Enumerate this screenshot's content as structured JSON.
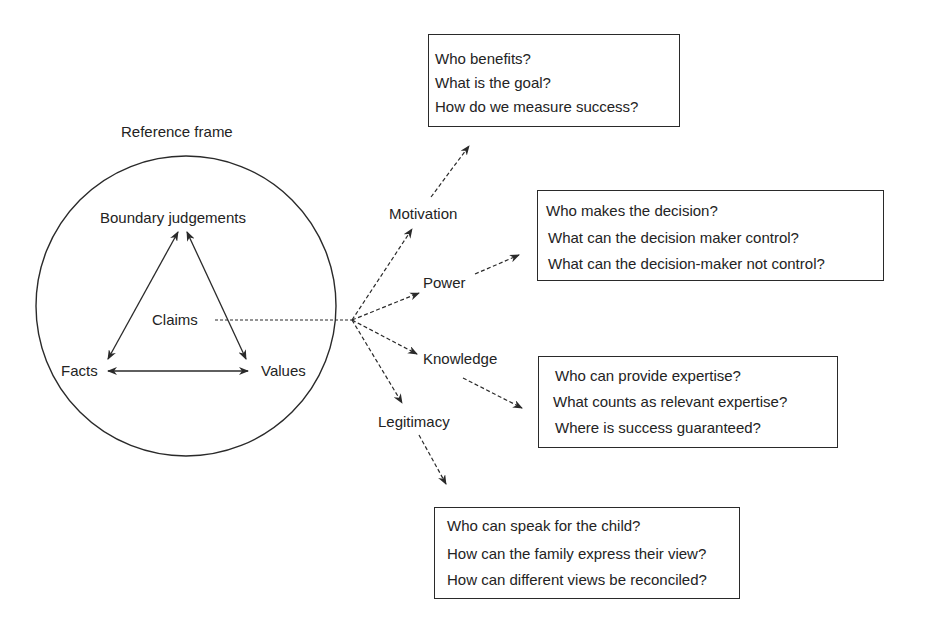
{
  "reference_frame": {
    "title": "Reference frame",
    "nodes": {
      "top": "Boundary judgements",
      "left": "Facts",
      "right": "Values",
      "center": "Claims"
    }
  },
  "dimensions": [
    {
      "label": "Motivation",
      "questions": [
        "Who benefits?",
        "What is the goal?",
        "How do we measure success?"
      ]
    },
    {
      "label": "Power",
      "questions": [
        "Who makes the decision?",
        "What can the decision maker control?",
        "What can the decision-maker not control?"
      ]
    },
    {
      "label": "Knowledge",
      "questions": [
        "Who can provide expertise?",
        "What counts as relevant expertise?",
        "Where is success guaranteed?"
      ]
    },
    {
      "label": "Legitimacy",
      "questions": [
        "Who can speak for the child?",
        "How can the family express their view?",
        "How can different views be reconciled?"
      ]
    }
  ],
  "colors": {
    "line": "#2a2a2a",
    "text": "#232323",
    "background": "#ffffff"
  }
}
